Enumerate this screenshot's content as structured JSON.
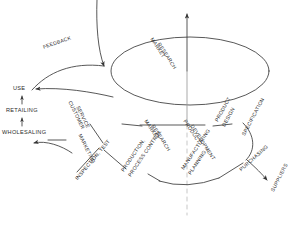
{
  "diagram": {
    "type": "cyclic-process-diagram",
    "stroke_color": "#3a3a3a",
    "background_color": "#ffffff",
    "text_color": "#2b2b2b"
  },
  "labels": {
    "feedback": "FEEDBACK",
    "use": "USE",
    "retailing": "RETAILING",
    "wholesaling": "WHOLESALING",
    "customer_service_1": "CUSTOMER",
    "customer_service_2": "SERVICE",
    "marketing": "MARKETING",
    "market_research_top_1": "MARKET",
    "market_research_top_2": "RESEARCH",
    "market_research_mid_1": "MARKET",
    "market_research_mid_2": "RESEARCH",
    "product_development_1": "PRODUCT",
    "product_development_2": "DEVELOPMENT",
    "product_design_1": "PRODUCT",
    "product_design_2": "DESIGN",
    "specification": "SPECIFICATION",
    "purchasing": "PURCHASING",
    "suppliers": "SUPPLIERS",
    "manufacturing_planning_1": "MANUFACTURING",
    "manufacturing_planning_2": "PLANNING",
    "production_process_1": "PRODUCTION,",
    "production_process_2": "PROCESS CONTROL",
    "inspection_test": "INSPECTION, TEST"
  }
}
